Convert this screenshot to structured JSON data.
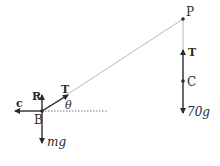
{
  "diagram": {
    "type": "force-diagram",
    "points": {
      "B": {
        "label": "B",
        "x": 42,
        "y": 111
      },
      "P": {
        "label": "P",
        "x": 183,
        "y": 19
      },
      "C": {
        "label": "C",
        "x": 183,
        "y": 81
      }
    },
    "forces_at_B": {
      "R": "R",
      "T": "T",
      "c": "c",
      "mg": "mg"
    },
    "forces_at_C": {
      "T": "T",
      "weight": "70g"
    },
    "angle_label": "θ",
    "colors": {
      "ink": "#2a2a2a",
      "string": "#b8b8b8",
      "background": "#ffffff"
    }
  }
}
